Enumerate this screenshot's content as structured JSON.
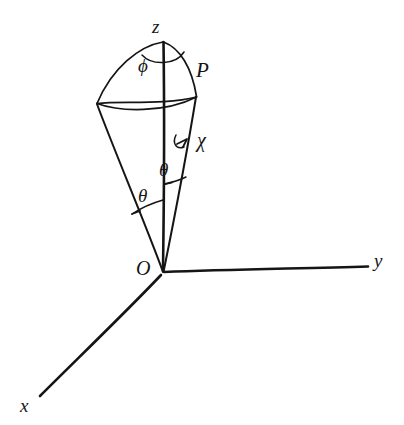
{
  "figure": {
    "kind": "hand-drawn-line-diagram",
    "background_color": "#ffffff",
    "ink_color": "#151515",
    "width": 404,
    "height": 425
  },
  "axes": [
    {
      "id": "x",
      "label": "x",
      "label_x": 20,
      "label_y": 396,
      "direction": "lower-left"
    },
    {
      "id": "y",
      "label": "y",
      "label_x": 374,
      "label_y": 251,
      "direction": "right"
    },
    {
      "id": "z",
      "label": "z",
      "label_x": 152,
      "label_y": 17,
      "direction": "up"
    }
  ],
  "points": [
    {
      "id": "origin",
      "label": "O",
      "label_x": 136,
      "label_y": 258,
      "x": 163,
      "y": 272
    },
    {
      "id": "P",
      "label": "P",
      "label_x": 196,
      "label_y": 60,
      "x": 196,
      "y": 97
    }
  ],
  "angles": [
    {
      "id": "phi",
      "label": "ϕ",
      "label_x": 138,
      "label_y": 56,
      "description": "azimuthal-angle-at-apex-of-cap"
    },
    {
      "id": "theta-left",
      "label": "θ",
      "label_x": 138,
      "label_y": 186,
      "description": "cone-half-angle-left-side"
    },
    {
      "id": "theta-right",
      "label": "θ",
      "label_x": 159,
      "label_y": 160,
      "description": "cone-half-angle-right-side"
    }
  ],
  "annotations": [
    {
      "id": "chi",
      "label": "χ",
      "label_x": 197,
      "label_y": 130,
      "description": "rotation-angle-chi-with-curved-arrow"
    }
  ]
}
